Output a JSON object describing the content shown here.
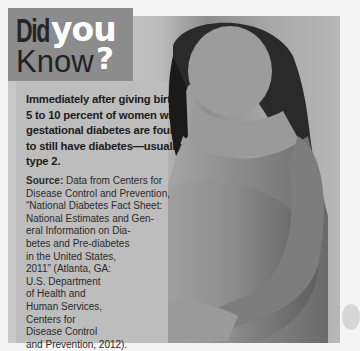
{
  "title": {
    "did": "Did",
    "you": "you",
    "know": "Know",
    "question_mark": "?"
  },
  "fact": "Immediately after giving birth, 5 to 10 percent of women with gestational diabetes are found to still have diabetes—usually type 2.",
  "fact_lines": [
    "Immediately after giving birth,",
    "5 to 10 percent of women with",
    "gestational diabetes are found",
    "to still have diabetes—usually",
    "type 2."
  ],
  "source": {
    "label": "Source:",
    "lines": [
      " Data from Centers for",
      "Disease Control and Prevention,",
      "“National Diabetes Fact Sheet:",
      "National Estimates and Gen-",
      "eral Information on Dia-",
      "betes and Pre-diabetes",
      "in the United States,",
      "2011” (Atlanta, GA:",
      "U.S. Department",
      "of Health and",
      "Human Services,",
      "Centers for",
      "Disease Control",
      "and Prevention, 2012)."
    ]
  },
  "image": {
    "description": "Black-and-white photo of a pregnant woman looking down, hands cradling her belly"
  },
  "colors": {
    "title_box": "#8c8c8c",
    "text_panel": "#bdbdbd",
    "you_text": "#ffffff",
    "did_text": "#262626"
  }
}
